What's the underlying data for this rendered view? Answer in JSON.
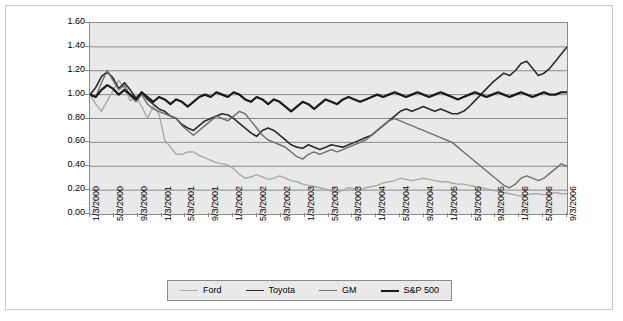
{
  "chart_data": {
    "type": "line",
    "title": "",
    "xlabel": "",
    "ylabel": "",
    "ylim": [
      0.0,
      1.6
    ],
    "ytick_labels": [
      "1.60",
      "1.40",
      "1.20",
      "1.00",
      "0.80",
      "0.60",
      "0.40",
      "0.20",
      "0.00"
    ],
    "ytick_values": [
      1.6,
      1.4,
      1.2,
      1.0,
      0.8,
      0.6,
      0.4,
      0.2,
      0.0
    ],
    "grid": true,
    "legend_position": "bottom",
    "x_tick_labels": [
      "1/3/2000",
      "5/3/2000",
      "9/3/2000",
      "1/3/2001",
      "5/3/2001",
      "9/3/2001",
      "1/3/2002",
      "5/3/2002",
      "9/3/2002",
      "1/3/2003",
      "5/3/2003",
      "9/3/2003",
      "1/3/2004",
      "5/3/2004",
      "9/3/2004",
      "1/3/2005",
      "5/3/2005",
      "9/3/2005",
      "1/3/2006",
      "5/3/2006",
      "9/3/2006"
    ],
    "x_tick_interval_months": 4,
    "x_points_per_tick": 4,
    "series": [
      {
        "name": "Ford",
        "color": "#a9a9a9",
        "width": 1.4,
        "values": [
          1.0,
          0.92,
          0.86,
          0.95,
          1.03,
          1.12,
          1.05,
          0.95,
          0.98,
          0.9,
          0.8,
          0.9,
          0.84,
          0.62,
          0.56,
          0.5,
          0.5,
          0.52,
          0.52,
          0.49,
          0.47,
          0.45,
          0.43,
          0.42,
          0.41,
          0.38,
          0.33,
          0.3,
          0.31,
          0.33,
          0.31,
          0.29,
          0.3,
          0.32,
          0.3,
          0.28,
          0.27,
          0.25,
          0.24,
          0.23,
          0.22,
          0.21,
          0.19,
          0.18,
          0.2,
          0.22,
          0.21,
          0.2,
          0.22,
          0.23,
          0.24,
          0.26,
          0.27,
          0.28,
          0.3,
          0.29,
          0.28,
          0.29,
          0.3,
          0.29,
          0.28,
          0.27,
          0.27,
          0.26,
          0.25,
          0.25,
          0.24,
          0.23,
          0.22,
          0.21,
          0.2,
          0.19,
          0.18,
          0.17,
          0.16,
          0.15,
          0.16,
          0.17,
          0.17,
          0.16,
          0.17,
          0.18,
          0.17,
          0.17
        ]
      },
      {
        "name": "Toyota",
        "color": "#2b2b2b",
        "width": 1.6,
        "values": [
          1.0,
          1.06,
          1.15,
          1.19,
          1.14,
          1.05,
          1.1,
          1.04,
          0.97,
          1.02,
          0.96,
          0.92,
          0.88,
          0.86,
          0.82,
          0.8,
          0.75,
          0.72,
          0.7,
          0.74,
          0.78,
          0.8,
          0.82,
          0.84,
          0.83,
          0.8,
          0.76,
          0.72,
          0.68,
          0.65,
          0.7,
          0.72,
          0.7,
          0.66,
          0.62,
          0.58,
          0.56,
          0.55,
          0.58,
          0.56,
          0.54,
          0.56,
          0.58,
          0.57,
          0.56,
          0.58,
          0.6,
          0.62,
          0.64,
          0.66,
          0.7,
          0.74,
          0.78,
          0.82,
          0.86,
          0.88,
          0.86,
          0.88,
          0.9,
          0.88,
          0.86,
          0.88,
          0.86,
          0.84,
          0.84,
          0.86,
          0.9,
          0.95,
          1.0,
          1.05,
          1.1,
          1.14,
          1.18,
          1.16,
          1.2,
          1.26,
          1.28,
          1.22,
          1.16,
          1.18,
          1.22,
          1.28,
          1.34,
          1.4
        ]
      },
      {
        "name": "GM",
        "color": "#6e6e6e",
        "width": 1.4,
        "values": [
          1.0,
          0.98,
          1.1,
          1.2,
          1.12,
          1.04,
          1.08,
          0.99,
          0.94,
          1.0,
          0.92,
          0.88,
          0.86,
          0.84,
          0.82,
          0.8,
          0.74,
          0.7,
          0.66,
          0.7,
          0.74,
          0.78,
          0.82,
          0.8,
          0.78,
          0.82,
          0.86,
          0.84,
          0.78,
          0.72,
          0.66,
          0.62,
          0.6,
          0.58,
          0.56,
          0.52,
          0.48,
          0.46,
          0.5,
          0.52,
          0.5,
          0.52,
          0.54,
          0.52,
          0.54,
          0.56,
          0.58,
          0.6,
          0.62,
          0.66,
          0.7,
          0.74,
          0.78,
          0.8,
          0.78,
          0.76,
          0.74,
          0.72,
          0.7,
          0.68,
          0.66,
          0.64,
          0.62,
          0.6,
          0.56,
          0.52,
          0.48,
          0.44,
          0.4,
          0.36,
          0.32,
          0.28,
          0.24,
          0.22,
          0.25,
          0.3,
          0.32,
          0.3,
          0.28,
          0.3,
          0.34,
          0.38,
          0.42,
          0.4
        ]
      },
      {
        "name": "S&P 500",
        "color": "#1a1a1a",
        "width": 2.2,
        "values": [
          1.0,
          0.98,
          1.04,
          1.08,
          1.05,
          1.0,
          1.04,
          1.0,
          0.96,
          1.02,
          0.98,
          0.94,
          0.98,
          0.96,
          0.92,
          0.96,
          0.94,
          0.9,
          0.94,
          0.98,
          1.0,
          0.98,
          1.02,
          1.0,
          0.98,
          1.02,
          1.0,
          0.96,
          0.94,
          0.98,
          0.96,
          0.92,
          0.96,
          0.94,
          0.9,
          0.86,
          0.9,
          0.94,
          0.92,
          0.88,
          0.92,
          0.96,
          0.94,
          0.92,
          0.96,
          0.98,
          0.96,
          0.94,
          0.96,
          0.98,
          1.0,
          0.98,
          1.0,
          1.02,
          1.0,
          0.98,
          1.0,
          1.02,
          1.0,
          0.98,
          1.0,
          1.02,
          1.0,
          0.98,
          0.96,
          0.98,
          1.0,
          1.02,
          1.0,
          0.98,
          1.0,
          1.02,
          1.0,
          0.98,
          1.0,
          1.02,
          1.0,
          0.98,
          1.0,
          1.02,
          1.0,
          1.0,
          1.02,
          1.02
        ]
      }
    ]
  },
  "legend": {
    "items": [
      {
        "label": "Ford",
        "color": "#a9a9a9"
      },
      {
        "label": "Toyota",
        "color": "#2b2b2b"
      },
      {
        "label": "GM",
        "color": "#6e6e6e"
      },
      {
        "label": "S&P 500",
        "color": "#1a1a1a"
      }
    ]
  }
}
